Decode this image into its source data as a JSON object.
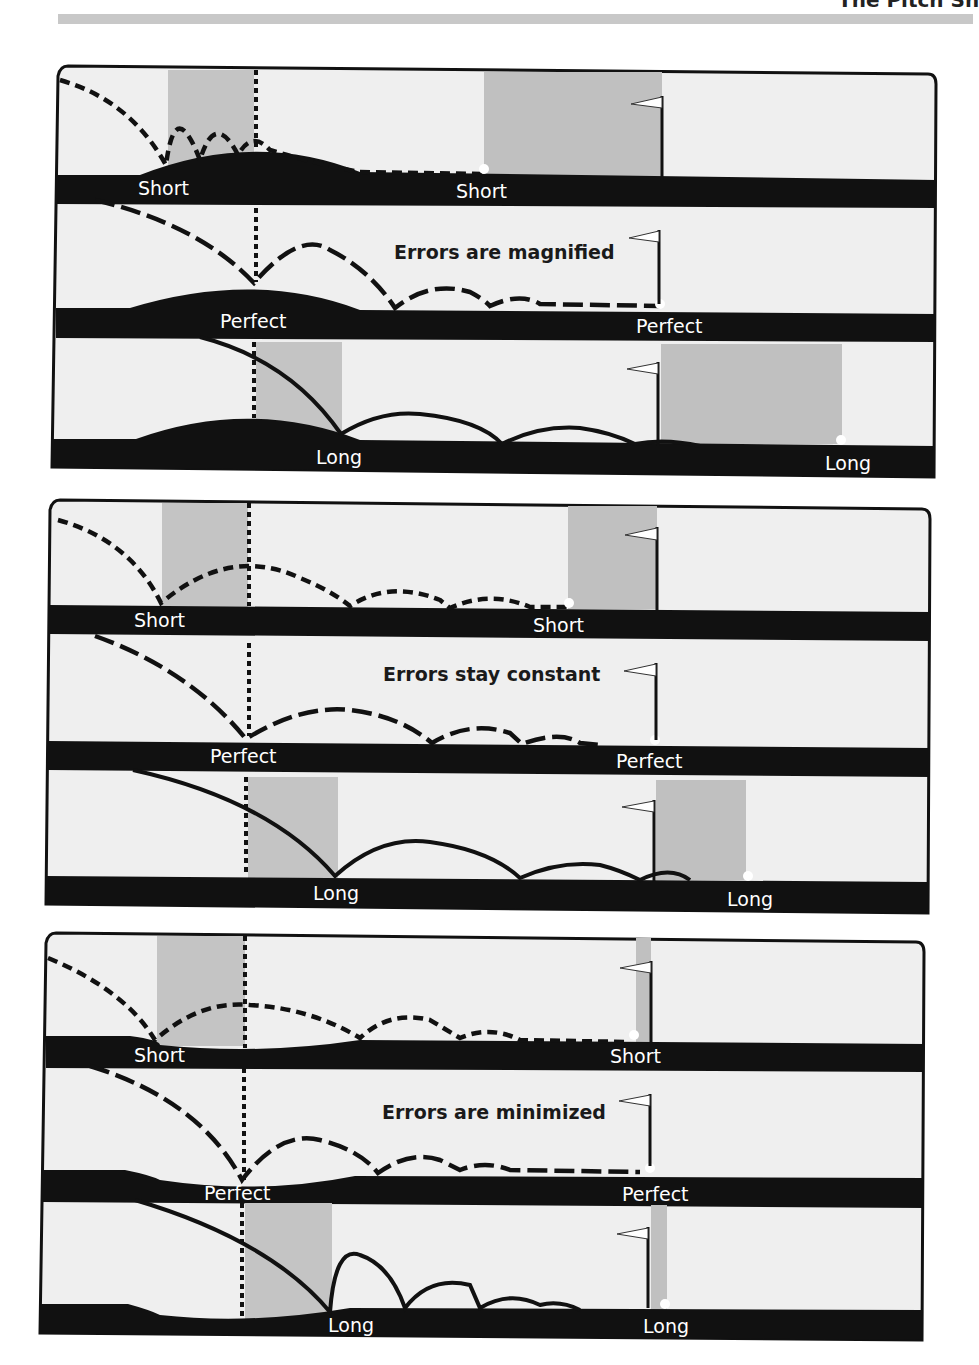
{
  "header": {
    "title_fragment": "The Pitch Sh"
  },
  "colors": {
    "background": "#efefef",
    "ground": "#111111",
    "landing_zone": "#bdbdbd",
    "trajectory": "#111111",
    "label_text": "#ffffff",
    "caption_text": "#1a1a1a",
    "ball": "#ffffff"
  },
  "figures": [
    {
      "green_shape": "crowned",
      "caption": "Errors are magnified",
      "strips": [
        {
          "shot": "short",
          "landing_label": "Short",
          "result_label": "Short",
          "line_style": "short-dash"
        },
        {
          "shot": "perfect",
          "landing_label": "Perfect",
          "result_label": "Perfect",
          "line_style": "long-dash"
        },
        {
          "shot": "long",
          "landing_label": "Long",
          "result_label": "Long",
          "line_style": "solid"
        }
      ]
    },
    {
      "green_shape": "flat",
      "caption": "Errors stay constant",
      "strips": [
        {
          "shot": "short",
          "landing_label": "Short",
          "result_label": "Short",
          "line_style": "short-dash"
        },
        {
          "shot": "perfect",
          "landing_label": "Perfect",
          "result_label": "Perfect",
          "line_style": "long-dash"
        },
        {
          "shot": "long",
          "landing_label": "Long",
          "result_label": "Long",
          "line_style": "solid"
        }
      ]
    },
    {
      "green_shape": "bowl",
      "caption": "Errors are minimized",
      "strips": [
        {
          "shot": "short",
          "landing_label": "Short",
          "result_label": "Short",
          "line_style": "short-dash"
        },
        {
          "shot": "perfect",
          "landing_label": "Perfect",
          "result_label": "Perfect",
          "line_style": "long-dash"
        },
        {
          "shot": "long",
          "landing_label": "Long",
          "result_label": "Long",
          "line_style": "solid"
        }
      ]
    }
  ]
}
